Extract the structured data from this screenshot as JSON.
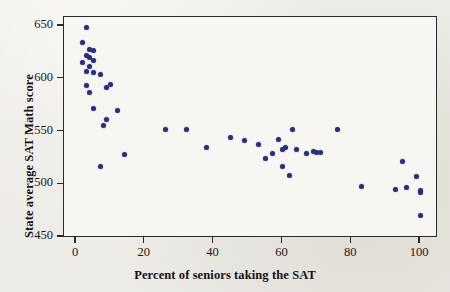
{
  "figure": {
    "background_color": "#eceae4",
    "plot_background_color": "#f7f6f3",
    "frame_color": "#2a2a2a",
    "marker_color": "#2b2f7a"
  },
  "chart_data": {
    "type": "scatter",
    "title": "",
    "xlabel": "Percent of seniors taking the SAT",
    "ylabel": "State average SAT Math score",
    "xlim": [
      -5,
      105
    ],
    "ylim": [
      450,
      660
    ],
    "xticks": [
      0,
      20,
      40,
      60,
      80,
      100
    ],
    "yticks": [
      450,
      500,
      550,
      600,
      650
    ],
    "xtick_labels": [
      "0",
      "20",
      "40",
      "60",
      "80",
      "100"
    ],
    "ytick_labels": [
      "450",
      "500",
      "550",
      "600",
      "650"
    ],
    "grid": false,
    "legend": null,
    "series": [
      {
        "name": "States",
        "marker": "circle",
        "color": "#2b2f7a",
        "points": [
          [
            3,
            649
          ],
          [
            2,
            634
          ],
          [
            4,
            628
          ],
          [
            3,
            622
          ],
          [
            5,
            627
          ],
          [
            4,
            620
          ],
          [
            2,
            615
          ],
          [
            5,
            617
          ],
          [
            4,
            612
          ],
          [
            3,
            607
          ],
          [
            5,
            606
          ],
          [
            7,
            604
          ],
          [
            3,
            594
          ],
          [
            4,
            587
          ],
          [
            5,
            572
          ],
          [
            9,
            592
          ],
          [
            10,
            595
          ],
          [
            9,
            561
          ],
          [
            12,
            570
          ],
          [
            8,
            556
          ],
          [
            7,
            517
          ],
          [
            14,
            528
          ],
          [
            26,
            552
          ],
          [
            32,
            552
          ],
          [
            38,
            535
          ],
          [
            45,
            544
          ],
          [
            49,
            541
          ],
          [
            53,
            538
          ],
          [
            55,
            524
          ],
          [
            57,
            529
          ],
          [
            59,
            542
          ],
          [
            60,
            533
          ],
          [
            61,
            535
          ],
          [
            60,
            517
          ],
          [
            62,
            508
          ],
          [
            64,
            533
          ],
          [
            63,
            552
          ],
          [
            67,
            529
          ],
          [
            69,
            531
          ],
          [
            70,
            530
          ],
          [
            71,
            530
          ],
          [
            76,
            552
          ],
          [
            83,
            498
          ],
          [
            93,
            495
          ],
          [
            95,
            522
          ],
          [
            99,
            507
          ],
          [
            100,
            494
          ],
          [
            100,
            492
          ],
          [
            96,
            497
          ],
          [
            100,
            470
          ]
        ]
      }
    ]
  }
}
